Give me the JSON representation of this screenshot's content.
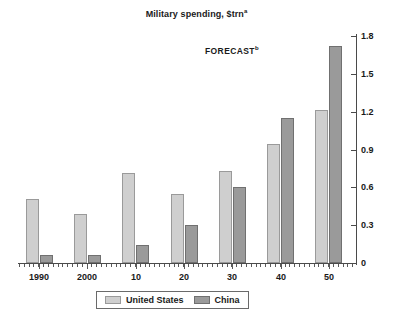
{
  "chart_data": {
    "type": "bar",
    "title": "Military spending, $trn",
    "title_superscript": "a",
    "xlabel": "",
    "ylabel": "",
    "ylim": [
      0,
      1.8
    ],
    "yticks": [
      "0",
      "0.3",
      "0.6",
      "0.9",
      "1.2",
      "1.5",
      "1.8"
    ],
    "ytick_values": [
      0,
      0.3,
      0.6,
      0.9,
      1.2,
      1.5,
      1.8
    ],
    "y_axis_position": "right",
    "grid": false,
    "categories": [
      "1990",
      "2000",
      "10",
      "20",
      "30",
      "40",
      "50"
    ],
    "series": [
      {
        "name": "United States",
        "color": "#cfcfcf",
        "values": [
          0.51,
          0.39,
          0.71,
          0.55,
          0.73,
          0.94,
          1.21
        ]
      },
      {
        "name": "China",
        "color": "#9a9a9a",
        "values": [
          0.06,
          0.06,
          0.14,
          0.3,
          0.6,
          1.15,
          1.72
        ]
      }
    ],
    "annotations": [
      {
        "text": "FORECAST",
        "superscript": "b"
      }
    ],
    "legend": {
      "position": "bottom",
      "entries": [
        {
          "label": "United States",
          "color": "#cfcfcf"
        },
        {
          "label": "China",
          "color": "#9a9a9a"
        }
      ]
    }
  },
  "colors": {
    "background": "#ffffff",
    "axis": "#4a4a4a",
    "text": "#1a1a1a",
    "series_us": "#cfcfcf",
    "series_china": "#9a9a9a"
  }
}
